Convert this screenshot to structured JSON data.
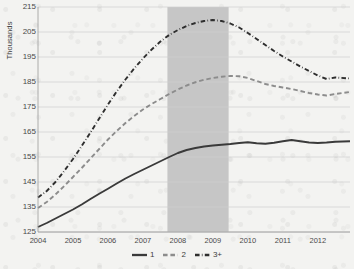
{
  "chart_data": {
    "type": "line",
    "title": "",
    "subtitle": "",
    "xlabel": "",
    "ylabel": "Thousands",
    "ylim": [
      125,
      215
    ],
    "xlim": [
      2004.0,
      2012.92
    ],
    "ytick_step": 10,
    "grid": true,
    "grid_axis": "y",
    "legend_position": "bottom-center",
    "yticks": [
      125,
      135,
      145,
      155,
      165,
      175,
      185,
      195,
      205,
      215
    ],
    "xticks": [
      2004,
      2005,
      2006,
      2007,
      2008,
      2009,
      2010,
      2011,
      2012
    ],
    "xtick_labels": [
      "2004",
      "2005",
      "2006",
      "2007",
      "2008",
      "2009",
      "2010",
      "2011",
      "2012"
    ],
    "annotations": [
      {
        "type": "vertical-band",
        "name": "recession-shading",
        "x_start": 2007.7,
        "x_end": 2009.45,
        "color": "#c6c6c6",
        "label": ""
      }
    ],
    "series": [
      {
        "name": "1",
        "label": "1",
        "color": "#3a3a3a",
        "style": "solid",
        "width": 1.9,
        "x": [
          2004.0,
          2004.25,
          2004.5,
          2004.75,
          2005.0,
          2005.25,
          2005.5,
          2005.75,
          2006.0,
          2006.25,
          2006.5,
          2006.75,
          2007.0,
          2007.25,
          2007.5,
          2007.75,
          2008.0,
          2008.25,
          2008.5,
          2008.75,
          2009.0,
          2009.25,
          2009.5,
          2009.75,
          2010.0,
          2010.25,
          2010.5,
          2010.75,
          2011.0,
          2011.25,
          2011.5,
          2011.75,
          2012.0,
          2012.25,
          2012.5,
          2012.92
        ],
        "values": [
          127.0,
          128.6,
          130.4,
          132.2,
          134.0,
          136.0,
          138.2,
          140.3,
          142.3,
          144.4,
          146.4,
          148.2,
          149.9,
          151.6,
          153.3,
          155.0,
          156.6,
          157.8,
          158.6,
          159.2,
          159.6,
          159.9,
          160.2,
          160.6,
          160.9,
          160.5,
          160.3,
          160.7,
          161.3,
          161.8,
          161.3,
          160.8,
          160.6,
          160.8,
          161.1,
          161.3
        ]
      },
      {
        "name": "2",
        "label": "2",
        "color": "#8c8c8c",
        "style": "dashed",
        "width": 1.9,
        "x": [
          2004.0,
          2004.25,
          2004.5,
          2004.75,
          2005.0,
          2005.25,
          2005.5,
          2005.75,
          2006.0,
          2006.25,
          2006.5,
          2006.75,
          2007.0,
          2007.25,
          2007.5,
          2007.75,
          2008.0,
          2008.25,
          2008.5,
          2008.75,
          2009.0,
          2009.25,
          2009.5,
          2009.75,
          2010.0,
          2010.25,
          2010.5,
          2010.75,
          2011.0,
          2011.25,
          2011.5,
          2011.75,
          2012.0,
          2012.25,
          2012.5,
          2012.92
        ],
        "values": [
          134.6,
          137.0,
          140.0,
          143.4,
          147.0,
          150.6,
          154.4,
          158.2,
          162.0,
          165.4,
          168.6,
          171.4,
          174.0,
          176.2,
          178.2,
          180.2,
          182.0,
          183.6,
          184.9,
          185.9,
          186.6,
          187.1,
          187.4,
          187.3,
          186.6,
          185.4,
          184.2,
          183.4,
          182.8,
          182.2,
          181.4,
          180.6,
          180.0,
          179.6,
          180.2,
          181.0
        ]
      },
      {
        "name": "3+",
        "label": "3+",
        "color": "#2e2e2e",
        "style": "dash-dot",
        "width": 1.9,
        "x": [
          2004.0,
          2004.25,
          2004.5,
          2004.75,
          2005.0,
          2005.25,
          2005.5,
          2005.75,
          2006.0,
          2006.25,
          2006.5,
          2006.75,
          2007.0,
          2007.25,
          2007.5,
          2007.75,
          2008.0,
          2008.25,
          2008.5,
          2008.75,
          2009.0,
          2009.25,
          2009.5,
          2009.75,
          2010.0,
          2010.25,
          2010.5,
          2010.75,
          2011.0,
          2011.25,
          2011.5,
          2011.75,
          2012.0,
          2012.25,
          2012.5,
          2012.92
        ],
        "values": [
          138.8,
          141.4,
          145.0,
          149.4,
          154.2,
          159.4,
          164.8,
          170.4,
          176.0,
          181.2,
          186.0,
          190.4,
          194.4,
          198.0,
          201.2,
          203.8,
          205.8,
          207.4,
          208.6,
          209.4,
          209.8,
          209.4,
          208.4,
          206.8,
          204.6,
          202.2,
          199.8,
          197.4,
          195.2,
          193.2,
          191.2,
          189.4,
          187.6,
          186.2,
          186.8,
          186.4
        ]
      }
    ]
  }
}
